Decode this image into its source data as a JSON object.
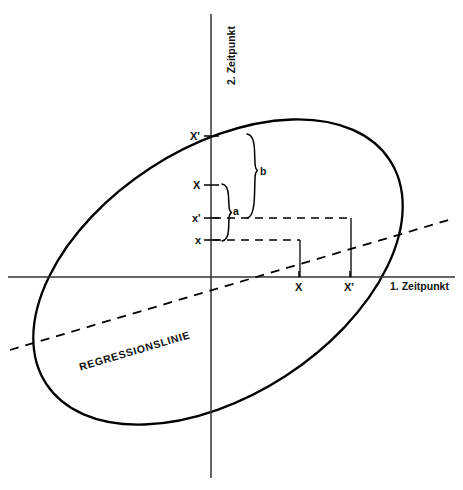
{
  "figure": {
    "type": "scatter-ellipse-regression-diagram",
    "background_color": "#ffffff",
    "line_color": "#000000",
    "width": 463,
    "height": 490
  },
  "axes": {
    "x": {
      "label": "1. Zeitpunkt",
      "label_x": 390,
      "label_y": 285,
      "line_y": 277,
      "line_x1": 8,
      "line_x2": 455,
      "ticks": [
        {
          "label": "X",
          "x": 299,
          "label_x": 295,
          "label_y": 284
        },
        {
          "label": "X'",
          "x": 350,
          "label_x": 344,
          "label_y": 284
        }
      ]
    },
    "y": {
      "label": "2. Zeitpunkt",
      "label_x": 217,
      "label_y": 82,
      "line_x": 211,
      "line_y1": 14,
      "line_y2": 478,
      "ticks": [
        {
          "label": "X'",
          "y": 136,
          "label_x": 190,
          "label_y": 132
        },
        {
          "label": "X",
          "y": 185,
          "label_x": 193,
          "label_y": 181
        },
        {
          "label": "x'",
          "y": 218,
          "label_x": 192,
          "label_y": 214
        },
        {
          "label": "x",
          "y": 240,
          "label_x": 194,
          "label_y": 236
        }
      ]
    }
  },
  "ellipse": {
    "center_x": 218,
    "center_y": 272,
    "radius_x": 205,
    "radius_y": 124,
    "rotation_deg": -33,
    "stroke_width": 2.3
  },
  "regression_line": {
    "label": "REGRESSIONSLINIE",
    "label_x": 78,
    "label_y": 358,
    "x1": 10,
    "y1": 350,
    "x2": 452,
    "y2": 219,
    "dash": "9 7",
    "stroke_width": 1.8
  },
  "connectors": {
    "dashed": [
      {
        "name": "x-to-X-horizontal",
        "x1": 213,
        "y1": 240,
        "x2": 300,
        "y2": 240
      },
      {
        "name": "xprime-to-Xprime-horizontal",
        "x1": 213,
        "y1": 218,
        "x2": 351,
        "y2": 218
      }
    ],
    "solid": [
      {
        "name": "X-vertical-drop",
        "x1": 300,
        "y1": 240,
        "x2": 300,
        "y2": 277
      },
      {
        "name": "Xprime-vertical-drop",
        "x1": 351,
        "y1": 218,
        "x2": 351,
        "y2": 277
      }
    ]
  },
  "braces": [
    {
      "name": "brace-a",
      "label": "a",
      "x": 227,
      "y_top": 184,
      "y_bottom": 241,
      "label_x": 232,
      "label_y": 208,
      "spans": "X to x"
    },
    {
      "name": "brace-b",
      "label": "b",
      "x": 253,
      "y_top": 134,
      "y_bottom": 218,
      "label_x": 259,
      "label_y": 168,
      "spans": "X' to x'"
    }
  ]
}
